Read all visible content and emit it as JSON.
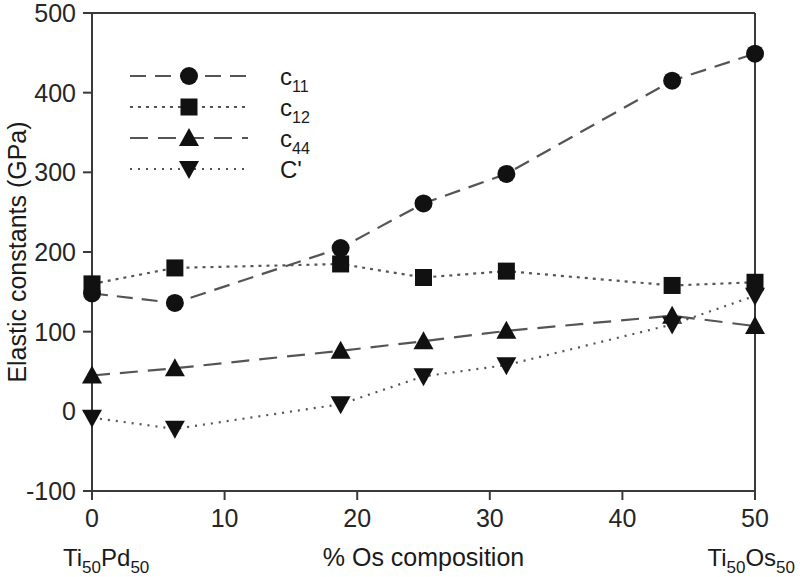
{
  "chart_data": {
    "type": "line",
    "title": "",
    "xlabel": "% Os composition",
    "ylabel": "Elastic constants (GPa)",
    "xlim": [
      0,
      50
    ],
    "ylim": [
      -100,
      500
    ],
    "xticks": [
      "0",
      "10",
      "20",
      "30",
      "40",
      "50"
    ],
    "xtick_values": [
      0,
      10,
      20,
      30,
      40,
      50
    ],
    "yticks": [
      "500",
      "400",
      "300",
      "200",
      "100",
      "0",
      "-100"
    ],
    "ytick_values": [
      500,
      400,
      300,
      200,
      100,
      0,
      -100
    ],
    "grid": false,
    "legend_position": "upper-left-inside",
    "x": [
      0,
      6.25,
      18.75,
      25,
      31.25,
      43.75,
      50
    ],
    "series": [
      {
        "name": "c11",
        "label_base": "c",
        "label_sub": "11",
        "marker": "circle",
        "values": [
          148,
          136,
          205,
          261,
          298,
          415,
          449
        ]
      },
      {
        "name": "c12",
        "label_base": "c",
        "label_sub": "12",
        "marker": "square",
        "values": [
          160,
          180,
          185,
          168,
          176,
          158,
          162
        ]
      },
      {
        "name": "c44",
        "label_base": "c",
        "label_sub": "44",
        "marker": "triangle-up",
        "values": [
          45,
          54,
          76,
          88,
          101,
          120,
          107
        ]
      },
      {
        "name": "Cprime",
        "label_base": "C'",
        "label_sub": "",
        "marker": "triangle-down",
        "values": [
          -8,
          -22,
          9,
          44,
          58,
          109,
          145
        ]
      }
    ],
    "annotations": {
      "left_end_label_base": "Ti",
      "left_end_label_sub1": "50",
      "left_end_label_mid": "Pd",
      "left_end_label_sub2": "50",
      "right_end_label_base": "Ti",
      "right_end_label_sub1": "50",
      "right_end_label_mid": "Os",
      "right_end_label_sub2": "50"
    },
    "colors": {
      "line": "#555555",
      "marker": "#111111",
      "axis": "#3a3a3a",
      "text": "#1a1a1a",
      "background": "#ffffff"
    }
  }
}
